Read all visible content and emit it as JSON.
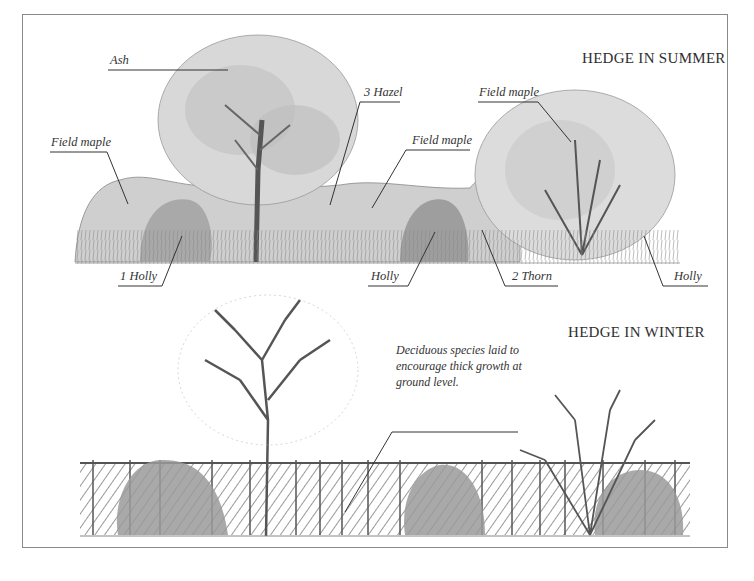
{
  "diagram": {
    "summer": {
      "title": "HEDGE IN SUMMER",
      "labels": [
        {
          "id": "ash",
          "text": "Ash"
        },
        {
          "id": "field-maple-left",
          "text": "Field maple"
        },
        {
          "id": "hazel",
          "text": "3 Hazel"
        },
        {
          "id": "field-maple-mid",
          "text": "Field maple"
        },
        {
          "id": "field-maple-right",
          "text": "Field maple"
        },
        {
          "id": "holly-1",
          "text": "1 Holly"
        },
        {
          "id": "holly-mid",
          "text": "Holly"
        },
        {
          "id": "thorn",
          "text": "2 Thorn"
        },
        {
          "id": "holly-right",
          "text": "Holly"
        }
      ]
    },
    "winter": {
      "title": "HEDGE IN WINTER",
      "note": "Deciduous species laid to encourage thick growth at ground level."
    }
  }
}
